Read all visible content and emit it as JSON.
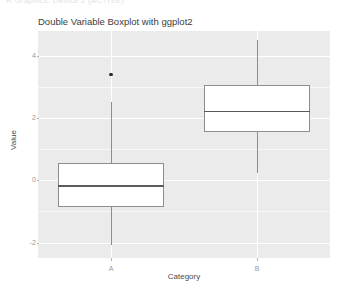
{
  "top_strip_text": "R Graphics: Device 2 (ACTIVE)",
  "chart_data": {
    "type": "box",
    "title": "Double Variable Boxplot with ggplot2",
    "xlabel": "Category",
    "ylabel": "Value",
    "categories": [
      "A",
      "B"
    ],
    "ylim": [
      -2.5,
      4.8
    ],
    "yticks": [
      4,
      2,
      0,
      -2
    ],
    "ytick_labels": [
      "4",
      "2",
      "0",
      "-2"
    ],
    "grid": true,
    "legend": "none",
    "theme": {
      "panel_background": "#ebebeb",
      "grid_color": "#ffffff",
      "box_fill": "#ffffff",
      "box_border": "#8e8e8e",
      "median_color": "#5a5a5a",
      "outlier_color": "#2b2b2b",
      "text_color": "#4a4a4a",
      "tick_text_color": "#9a9a9a"
    },
    "boxes": [
      {
        "category": "A",
        "whisker_low": -2.07,
        "q1": -0.85,
        "median": -0.16,
        "q3": 0.56,
        "whisker_high": 2.52,
        "outliers": [
          3.41
        ]
      },
      {
        "category": "B",
        "whisker_low": 0.23,
        "q1": 1.54,
        "median": 2.23,
        "q3": 3.05,
        "whisker_high": 4.52,
        "outliers": []
      }
    ]
  }
}
